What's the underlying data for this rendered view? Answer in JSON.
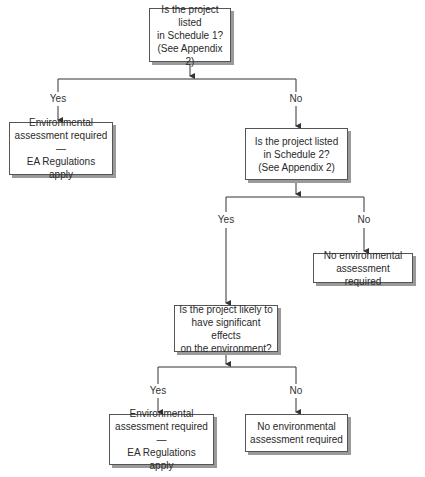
{
  "diagram": {
    "type": "flowchart",
    "nodes": {
      "q1": {
        "text": "Is the project listed\nin Schedule 1?\n(See Appendix 2)"
      },
      "ea1": {
        "text": "Environmental\nassessment required —\nEA Regulations apply"
      },
      "q2": {
        "text": "Is the project listed\nin Schedule 2?\n(See Appendix 2)"
      },
      "noea1": {
        "text": "No environmental\nassessment required"
      },
      "q3": {
        "text": "Is the project likely to\nhave significant effects\non the environment?"
      },
      "ea2": {
        "text": "Environmental\nassessment required —\nEA Regulations apply"
      },
      "noea2": {
        "text": "No environmental\nassessment required"
      }
    },
    "edge_labels": {
      "q1_yes": "Yes",
      "q1_no": "No",
      "q2_yes": "Yes",
      "q2_no": "No",
      "q3_yes": "Yes",
      "q3_no": "No"
    },
    "edges": [
      {
        "from": "q1",
        "to": "ea1",
        "label": "Yes"
      },
      {
        "from": "q1",
        "to": "q2",
        "label": "No"
      },
      {
        "from": "q2",
        "to": "q3",
        "label": "Yes"
      },
      {
        "from": "q2",
        "to": "noea1",
        "label": "No"
      },
      {
        "from": "q3",
        "to": "ea2",
        "label": "Yes"
      },
      {
        "from": "q3",
        "to": "noea2",
        "label": "No"
      }
    ],
    "colors": {
      "line": "#333333",
      "border": "#555555",
      "shadow": "#9a9a9a"
    }
  }
}
